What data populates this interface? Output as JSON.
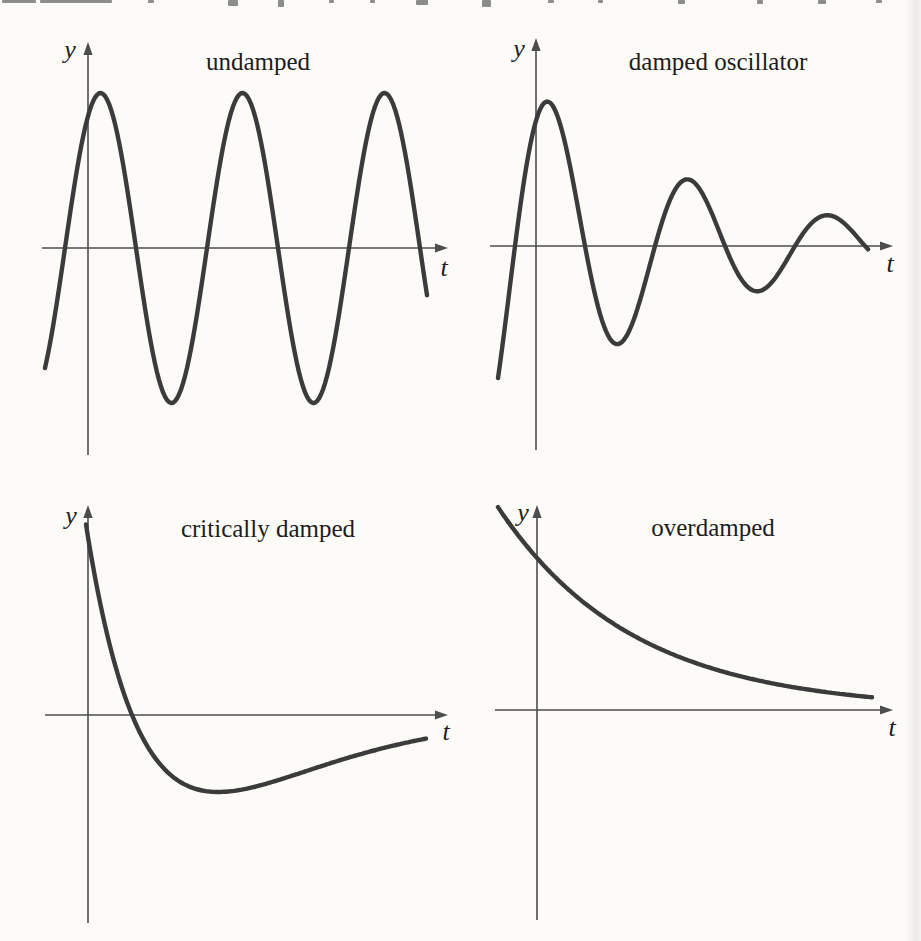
{
  "page": {
    "background": "#fcfbf8",
    "top_clipped_line": {
      "note": "bottom slivers of a cropped line of body text (unreadable)",
      "fragments": [
        {
          "x": 2,
          "w": 34,
          "h": 3
        },
        {
          "x": 40,
          "w": 72,
          "h": 3
        },
        {
          "x": 148,
          "w": 6,
          "h": 3
        },
        {
          "x": 228,
          "w": 10,
          "h": 6
        },
        {
          "x": 278,
          "w": 6,
          "h": 7
        },
        {
          "x": 329,
          "w": 5,
          "h": 3
        },
        {
          "x": 370,
          "w": 5,
          "h": 3
        },
        {
          "x": 416,
          "w": 12,
          "h": 5
        },
        {
          "x": 482,
          "w": 9,
          "h": 7
        },
        {
          "x": 548,
          "w": 6,
          "h": 3
        },
        {
          "x": 598,
          "w": 5,
          "h": 3
        },
        {
          "x": 678,
          "w": 7,
          "h": 4
        },
        {
          "x": 757,
          "w": 6,
          "h": 4
        },
        {
          "x": 818,
          "w": 8,
          "h": 4
        },
        {
          "x": 876,
          "w": 6,
          "h": 3
        }
      ]
    }
  },
  "colors": {
    "curve": "#3b3b3b",
    "axis": "#4d4d4d",
    "text": "#161616",
    "background": "#fcfbf8",
    "scan_shade": "#e3e3e3"
  },
  "chart_data": [
    {
      "key": "undamped",
      "title": "undamped",
      "type": "line",
      "xlabel": "t",
      "ylabel": "y",
      "description": "constant-amplitude sinusoid, about 2.7 periods shown; axes unlabeled, no ticks, no grid",
      "formula": "y(t) = A sin(2π t / T)",
      "curve": "sine",
      "units": "pixels of the 921x941 figure (qualitative sketch, axes carry no numbers)",
      "params": {
        "amplitude": 155,
        "period": 142,
        "zero_crossing_x": 65,
        "x_start": 45,
        "x_end": 428
      },
      "layout": {
        "origin_x": 88,
        "axis_y": 248,
        "y_top": 42,
        "y_bottom": 455,
        "x_left": 42,
        "x_right": 448
      },
      "axes": {
        "ticks": "none",
        "grid": false
      }
    },
    {
      "key": "damped-oscillator",
      "title": "damped oscillator",
      "type": "line",
      "xlabel": "t",
      "ylabel": "y",
      "description": "underdamped sinusoid with exponentially decaying envelope; successive extrema shrink by ~0.68 each half period",
      "formula": "y(t) = A e^(-t/τ) sin(2π t / T)",
      "curve": "damped_sine",
      "units": "pixels of the 921x941 figure (qualitative sketch, axes carry no numbers)",
      "params": {
        "peak_envelope": 174,
        "tau": 181,
        "period": 140,
        "zero_crossing_x": 515,
        "x_start": 498,
        "x_end": 868
      },
      "layout": {
        "origin_x": 536,
        "axis_y": 246,
        "y_top": 38,
        "y_bottom": 450,
        "x_left": 490,
        "x_right": 893
      },
      "axes": {
        "ticks": "none",
        "grid": false
      }
    },
    {
      "key": "critically-damped",
      "title": "critically damped",
      "type": "line",
      "xlabel": "t",
      "ylabel": "y",
      "description": "starts high at t=0, falls steeply, crosses the axis once, undershoots to a shallow minimum, then creeps back toward the axis from below",
      "formula": "y(t) = (a + b t) e^(-λ t)",
      "curve": "critically_damped",
      "units": "pixels of the 921x941 figure (qualitative sketch, axes carry no numbers)",
      "params": {
        "initial_value": 178,
        "zero_crossing_dt": 44,
        "lambda": 0.0116,
        "x_start": 86,
        "x_end": 427
      },
      "layout": {
        "origin_x": 88,
        "axis_y": 715,
        "y_top": 505,
        "y_bottom": 923,
        "x_left": 45,
        "x_right": 448
      },
      "axes": {
        "ticks": "none",
        "grid": false
      }
    },
    {
      "key": "overdamped",
      "title": "overdamped",
      "type": "line",
      "xlabel": "t",
      "ylabel": "y",
      "description": "monotonic exponential decay toward the t-axis, never crossing it",
      "formula": "y(t) = A e^(-λ t)",
      "curve": "overdamped",
      "units": "pixels of the 921x941 figure (qualitative sketch, axes carry no numbers)",
      "params": {
        "value_at_axis": 152,
        "lambda": 0.0074,
        "x_start": 498,
        "x_end": 872
      },
      "layout": {
        "origin_x": 537,
        "axis_y": 710,
        "y_top": 505,
        "y_bottom": 920,
        "x_left": 495,
        "x_right": 893
      },
      "axes": {
        "ticks": "none",
        "grid": false
      }
    }
  ]
}
